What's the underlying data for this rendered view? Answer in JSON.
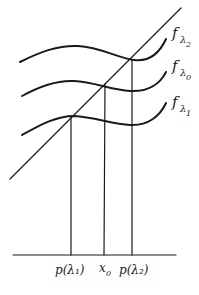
{
  "diagram": {
    "curves": [
      {
        "id": "f-lambda-2",
        "label_main": "f",
        "label_sub": "λ",
        "label_subsub": "2"
      },
      {
        "id": "f-lambda-0",
        "label_main": "f",
        "label_sub": "λ",
        "label_subsub": "0"
      },
      {
        "id": "f-lambda-1",
        "label_main": "f",
        "label_sub": "λ",
        "label_subsub": "1"
      }
    ],
    "axis_labels": [
      {
        "id": "p-lambda-1",
        "text": "p(λ₁)"
      },
      {
        "id": "x-0",
        "main": "x",
        "sub": "0"
      },
      {
        "id": "p-lambda-2",
        "text": "p(λ₂)"
      }
    ],
    "stroke_color": "#1a1a1a",
    "background_color": "#ffffff"
  }
}
